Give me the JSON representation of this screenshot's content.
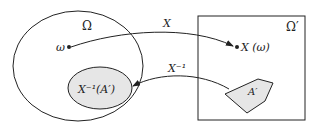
{
  "diagram": {
    "sample_space_label": "Ω",
    "target_space_label": "Ω′",
    "point_label": "ω",
    "image_point_label": "X (ω)",
    "forward_map_label": "X",
    "inverse_map_label": "X⁻¹",
    "preimage_label": "X⁻¹(A′)",
    "set_label": "A′",
    "colors": {
      "stroke": "#222222",
      "fill": "#e6e6e6",
      "background": "#ffffff"
    }
  }
}
